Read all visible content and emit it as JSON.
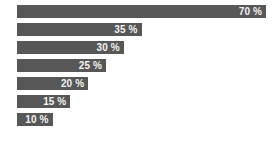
{
  "chart_data": {
    "type": "bar",
    "orientation": "horizontal",
    "title": "",
    "subtitle": "",
    "xlabel": "",
    "ylabel": "",
    "categories": [
      "",
      "",
      "",
      "",
      "",
      "",
      ""
    ],
    "values": [
      70,
      35,
      30,
      25,
      20,
      15,
      10
    ],
    "data_labels": [
      "70 %",
      "35 %",
      "30 %",
      "25 %",
      "20 %",
      "15 %",
      "10 %"
    ],
    "unit": "%",
    "xlim": [
      0,
      70
    ],
    "grid": false,
    "legend": false,
    "legend_position": "none",
    "axes_visible": false,
    "tick_labels": [],
    "annotations": [],
    "colors": {
      "bar": "#575757",
      "label_text": "#f2f2f2",
      "background": "#ffffff"
    }
  }
}
